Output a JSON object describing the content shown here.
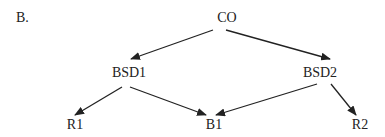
{
  "panel_label": "B.",
  "nodes": [
    {
      "id": "CO",
      "label": "CO",
      "x": 227,
      "y": 11
    },
    {
      "id": "BSD1",
      "label": "BSD1",
      "x": 129,
      "y": 66
    },
    {
      "id": "BSD2",
      "label": "BSD2",
      "x": 320,
      "y": 66
    },
    {
      "id": "R1",
      "label": "R1",
      "x": 75,
      "y": 118
    },
    {
      "id": "B1",
      "label": "B1",
      "x": 214,
      "y": 118
    },
    {
      "id": "R2",
      "label": "R2",
      "x": 360,
      "y": 118
    }
  ],
  "edges": [
    {
      "from": "CO",
      "to": "BSD1",
      "x1": 213,
      "y1": 30,
      "x2": 131,
      "y2": 59
    },
    {
      "from": "CO",
      "to": "BSD2",
      "x1": 226,
      "y1": 30,
      "x2": 330,
      "y2": 59
    },
    {
      "from": "BSD1",
      "to": "R1",
      "x1": 122,
      "y1": 87,
      "x2": 75,
      "y2": 115
    },
    {
      "from": "BSD1",
      "to": "B1",
      "x1": 130,
      "y1": 87,
      "x2": 206,
      "y2": 115
    },
    {
      "from": "BSD2",
      "to": "B1",
      "x1": 317,
      "y1": 84,
      "x2": 216,
      "y2": 115
    },
    {
      "from": "BSD2",
      "to": "R2",
      "x1": 331,
      "y1": 84,
      "x2": 356,
      "y2": 115
    }
  ],
  "colors": {
    "stroke": "#222222",
    "text": "#222222",
    "background": "#ffffff"
  }
}
